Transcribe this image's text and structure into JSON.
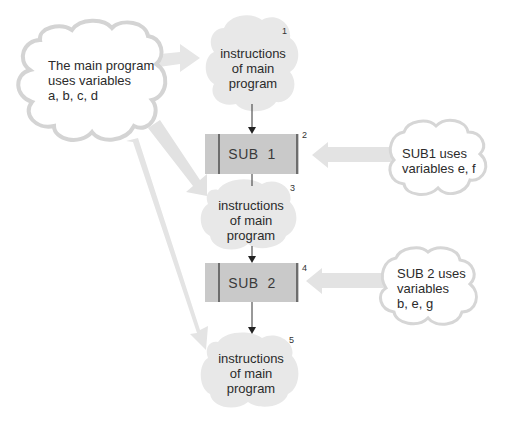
{
  "colors": {
    "cloud_fill": "#e6e6e6",
    "cloud_outline": "#d2d2d2",
    "sub_box_fill": "#c9c9c9",
    "sub_box_bar": "#6d6d6d",
    "wide_arrow": "#e0e0e0",
    "flow_line": "#333333"
  },
  "main_variables_note": {
    "line1": "The main program",
    "line2": "uses variables",
    "line3": "a, b, c, d"
  },
  "flow": [
    {
      "id": "block1",
      "type": "instructions",
      "number": "1",
      "line1": "instructions",
      "line2": "of main",
      "line3": "program"
    },
    {
      "id": "sub1",
      "type": "subroutine",
      "number": "2",
      "label": "SUB  1"
    },
    {
      "id": "block3",
      "type": "instructions",
      "number": "3",
      "line1": "instructions",
      "line2": "of main",
      "line3": "program"
    },
    {
      "id": "sub2",
      "type": "subroutine",
      "number": "4",
      "label": "SUB  2"
    },
    {
      "id": "block5",
      "type": "instructions",
      "number": "5",
      "line1": "instructions",
      "line2": "of main",
      "line3": "program"
    }
  ],
  "sub1_note": {
    "line1": "SUB1 uses",
    "line2": "variables e, f"
  },
  "sub2_note": {
    "line1": "SUB 2 uses",
    "line2": "variables",
    "line3": "b, e, g"
  }
}
